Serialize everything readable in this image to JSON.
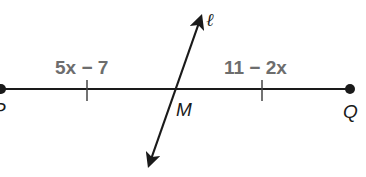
{
  "diagram": {
    "segment": {
      "name": "PQ",
      "endpoints": [
        {
          "label": "P",
          "x": 1,
          "y": 89
        },
        {
          "label": "Q",
          "x": 350,
          "y": 89
        }
      ],
      "midpoint": {
        "label": "M",
        "x": 173,
        "y": 89
      },
      "tick_marks": [
        {
          "x": 87
        },
        {
          "x": 262
        }
      ]
    },
    "segment_expressions": {
      "PM": "5x − 7",
      "MQ": "11 − 2x"
    },
    "bisector": {
      "label": "ℓ",
      "start": {
        "x": 147,
        "y": 170
      },
      "end": {
        "x": 203,
        "y": 12
      }
    },
    "colors": {
      "line": "#1a1a1a",
      "expression_text": "#6d6d6d"
    }
  }
}
